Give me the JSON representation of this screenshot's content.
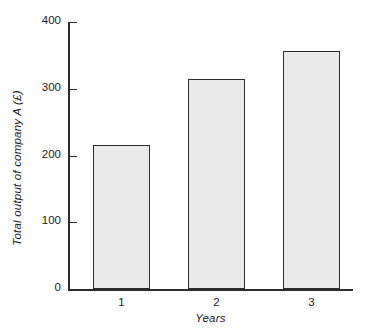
{
  "chart_data": {
    "type": "bar",
    "title": "",
    "categories": [
      "1",
      "2",
      "3"
    ],
    "values": [
      216,
      315,
      357
    ],
    "xlabel": "Years",
    "ylabel": "Total output of company A (£)",
    "ylim": [
      0,
      400
    ],
    "yticks": [
      0,
      100,
      200,
      300,
      400
    ],
    "ytick_labels": [
      "0",
      "100",
      "200",
      "300",
      "400"
    ],
    "grid": false,
    "legend": null,
    "bar_fill_color": "#e9e9e9",
    "bar_edge_color": "#2b2b2b",
    "axis_color": "#2b2b2b",
    "background_color": "#ffffff"
  }
}
